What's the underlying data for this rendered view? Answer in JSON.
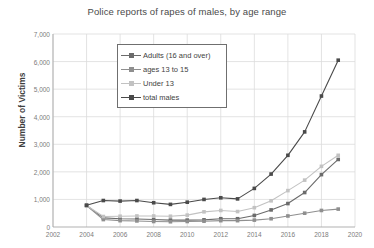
{
  "chart_data": {
    "type": "line",
    "title": "Police reports of rapes of males, by age range",
    "xlabel": "",
    "ylabel": "Number of Victims",
    "xlim": [
      2002,
      2020
    ],
    "ylim": [
      0,
      7000
    ],
    "xticks": [
      2002,
      2004,
      2006,
      2008,
      2010,
      2012,
      2014,
      2016,
      2018,
      2020
    ],
    "yticks": [
      0,
      1000,
      2000,
      3000,
      4000,
      5000,
      6000,
      7000
    ],
    "ytick_labels": [
      "0",
      "1,000",
      "2,000",
      "3,000",
      "4,000",
      "5,000",
      "6,000",
      "7,000"
    ],
    "xtick_labels": [
      "2002",
      "2004",
      "2006",
      "2008",
      "2010",
      "2012",
      "2014",
      "2016",
      "2018",
      "2020"
    ],
    "grid": true,
    "legend_position": "upper-left-inside",
    "x": [
      2004,
      2005,
      2006,
      2007,
      2008,
      2009,
      2010,
      2011,
      2012,
      2013,
      2014,
      2015,
      2016,
      2017,
      2018,
      2019
    ],
    "series": [
      {
        "name": "Adults (16 and over)",
        "color": "#6b6b6b",
        "values": [
          780,
          330,
          300,
          290,
          270,
          250,
          250,
          260,
          300,
          300,
          420,
          620,
          850,
          1250,
          1900,
          2450
        ]
      },
      {
        "name": "ages 13 to 15",
        "color": "#8f8f8f",
        "values": [
          780,
          270,
          230,
          220,
          200,
          190,
          200,
          210,
          230,
          230,
          250,
          300,
          400,
          500,
          600,
          650
        ]
      },
      {
        "name": "Under 13",
        "color": "#c2c2c2",
        "values": [
          780,
          380,
          390,
          400,
          400,
          390,
          430,
          550,
          600,
          560,
          700,
          950,
          1320,
          1700,
          2200,
          2600
        ]
      },
      {
        "name": "total males",
        "color": "#4a4a4a",
        "values": [
          790,
          960,
          940,
          960,
          880,
          820,
          900,
          1000,
          1060,
          1020,
          1400,
          1920,
          2600,
          3450,
          4750,
          6050
        ]
      }
    ]
  }
}
